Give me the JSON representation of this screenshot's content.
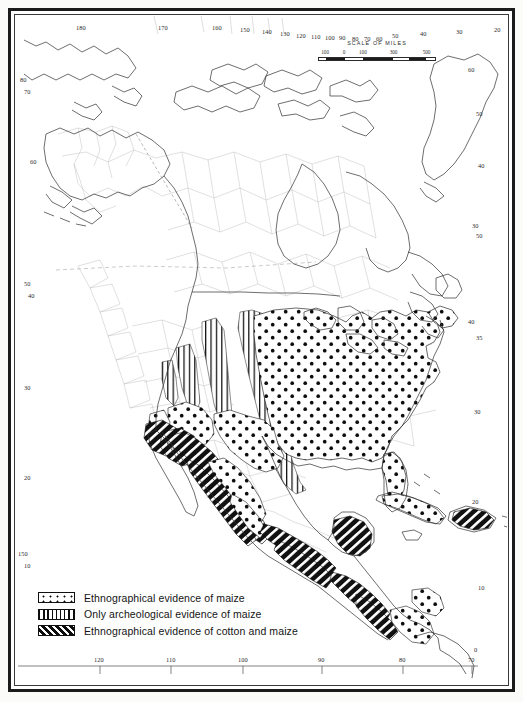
{
  "map": {
    "title": "Distribution of maize and cotton in North America",
    "projection_note": "North America, Central America and the Caribbean",
    "background_color": "#ffffff",
    "ink_color": "#1b1b1b",
    "tribal_line_color": "#9a9a9a",
    "coast_line_color": "#3d3d3d"
  },
  "scale": {
    "title": "SCALE OF MILES",
    "ticks": [
      "100",
      "0",
      "100",
      "300",
      "500"
    ],
    "tick_positions_pct": [
      6,
      22,
      38,
      64,
      92
    ]
  },
  "legend": {
    "items": [
      {
        "pattern": "dots",
        "label": "Ethnographical evidence of maize"
      },
      {
        "pattern": "vertical",
        "label": "Only archeological evidence of maize"
      },
      {
        "pattern": "diagonal",
        "label": "Ethnographical evidence of cotton and maize"
      }
    ]
  },
  "graticule": {
    "top_labels": [
      "180",
      "170",
      "160",
      "150",
      "140",
      "130",
      "120",
      "110",
      "100",
      "90",
      "80",
      "70",
      "60",
      "50",
      "40",
      "30",
      "20"
    ],
    "bottom_labels": [
      "120",
      "110",
      "100",
      "90",
      "80",
      "70"
    ],
    "left_labels": [
      "80",
      "70",
      "60",
      "50",
      "40",
      "30",
      "20",
      "150",
      "10"
    ],
    "right_labels": [
      "60",
      "50",
      "40",
      "30",
      "50",
      "40",
      "35",
      "30",
      "20",
      "10"
    ]
  },
  "regions": [
    {
      "name": "eastern-united-states",
      "pattern": "dots",
      "evidence": "Ethnographical evidence of maize"
    },
    {
      "name": "great-plains",
      "pattern": "vertical",
      "evidence": "Only archeological evidence of maize"
    },
    {
      "name": "american-southwest",
      "pattern": "diagonal",
      "evidence": "Ethnographical evidence of cotton and maize"
    },
    {
      "name": "northwest-mexico",
      "pattern": "diagonal",
      "evidence": "Ethnographical evidence of cotton and maize"
    },
    {
      "name": "southern-mexico",
      "pattern": "diagonal",
      "evidence": "Ethnographical evidence of cotton and maize"
    },
    {
      "name": "central-america",
      "pattern": "diagonal",
      "evidence": "Ethnographical evidence of cotton and maize"
    },
    {
      "name": "cuba",
      "pattern": "dots",
      "evidence": "Ethnographical evidence of maize"
    },
    {
      "name": "hispaniola",
      "pattern": "diagonal",
      "evidence": "Ethnographical evidence of cotton and maize"
    },
    {
      "name": "panama-colombia-edge",
      "pattern": "dots",
      "evidence": "Ethnographical evidence of maize"
    }
  ]
}
